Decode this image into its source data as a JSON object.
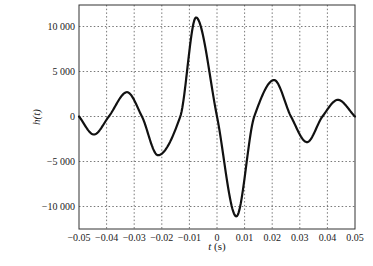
{
  "chart_data": {
    "type": "line",
    "title": "",
    "xlabel": "t (s)",
    "ylabel": "h(t)",
    "xlim": [
      -0.05,
      0.05
    ],
    "ylim": [
      -12500,
      12500
    ],
    "grid": true,
    "legend": null,
    "xticks": [
      -0.05,
      -0.04,
      -0.03,
      -0.02,
      -0.01,
      0,
      0.01,
      0.02,
      0.03,
      0.04,
      0.05
    ],
    "xtick_labels": [
      "−0.05",
      "−0.04",
      "−0.03",
      "−0.02",
      "−0.01",
      "0",
      "0.01",
      "0.02",
      "0.03",
      "0.04",
      "0.05"
    ],
    "yticks": [
      10000,
      5000,
      0,
      -5000,
      -10000
    ],
    "ytick_labels": [
      "10 000",
      "5 000",
      "0",
      "−5 000",
      "−10 000"
    ],
    "series": [
      {
        "name": "h(t)",
        "color": "#111111",
        "x": [
          -0.05,
          -0.0446,
          -0.0392,
          -0.0326,
          -0.0272,
          -0.0214,
          -0.0133,
          -0.0076,
          0.0,
          0.007,
          0.0135,
          0.0207,
          0.0268,
          0.0326,
          0.0382,
          0.0438,
          0.05
        ],
        "y": [
          0,
          -2000,
          0,
          2700,
          0,
          -4300,
          0,
          11000,
          0,
          -11100,
          0,
          4050,
          0,
          -2850,
          0,
          1850,
          0
        ]
      }
    ]
  },
  "labels": {
    "xlabel_t": "t",
    "xlabel_unit": " (s)",
    "ylabel": "h(t)"
  }
}
